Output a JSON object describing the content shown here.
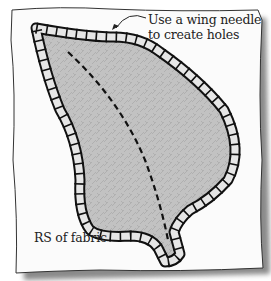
{
  "diagram": {
    "annotations": {
      "callout_line1": "Use a wing needle",
      "callout_line2": "to create holes",
      "fabric_side": "RS of fabric"
    },
    "colors": {
      "fabric": "#fbfbfb",
      "fabric_shadow": "#9a9a9a",
      "leaf_fill": "#bdbdbd",
      "stitch": "#111111",
      "stitch_fill": "#e6e6e6"
    }
  }
}
